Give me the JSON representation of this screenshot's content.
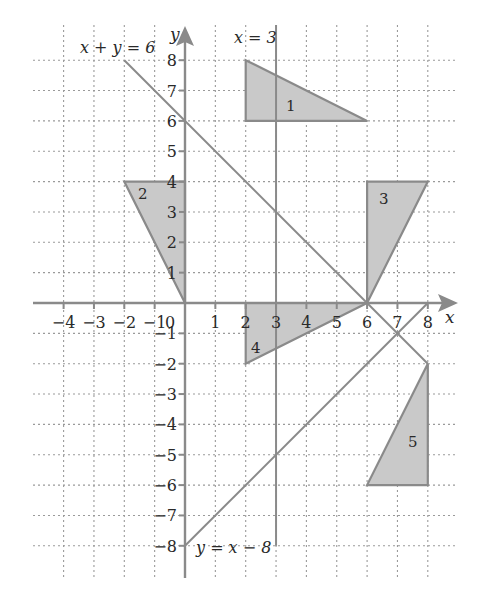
{
  "figure": {
    "axes": {
      "x_label": "x",
      "y_label": "y",
      "origin_label": "0",
      "x_ticks": [
        "-4",
        "-3",
        "-2",
        "-1",
        "1",
        "2",
        "3",
        "4",
        "5",
        "6",
        "7",
        "8"
      ],
      "y_ticks": [
        "8",
        "7",
        "6",
        "5",
        "4",
        "3",
        "2",
        "1",
        "-1",
        "-2",
        "-3",
        "-4",
        "-5",
        "-6",
        "-7",
        "-8"
      ],
      "x_range": [
        -5,
        9
      ],
      "y_range": [
        -9,
        9
      ],
      "grid": "dotted, 1 unit"
    },
    "lines": [
      {
        "label": "x + y = 6",
        "from": [
          -2,
          8
        ],
        "to": [
          8,
          -2
        ]
      },
      {
        "label": "x = 3",
        "from": [
          3,
          9
        ],
        "to": [
          3,
          -8
        ]
      },
      {
        "label": "y = x − 8",
        "from": [
          0,
          -8
        ],
        "to": [
          8,
          0
        ]
      }
    ],
    "shapes": [
      {
        "label": "1",
        "vertices": [
          [
            2,
            8
          ],
          [
            2,
            6
          ],
          [
            6,
            6
          ]
        ]
      },
      {
        "label": "2",
        "vertices": [
          [
            -2,
            4
          ],
          [
            0,
            4
          ],
          [
            0,
            0
          ]
        ]
      },
      {
        "label": "3",
        "vertices": [
          [
            6,
            4
          ],
          [
            8,
            4
          ],
          [
            6,
            0
          ]
        ]
      },
      {
        "label": "4",
        "vertices": [
          [
            2,
            0
          ],
          [
            6,
            0
          ],
          [
            2,
            -2
          ]
        ]
      },
      {
        "label": "5",
        "vertices": [
          [
            8,
            -2
          ],
          [
            8,
            -6
          ],
          [
            6,
            -6
          ]
        ]
      }
    ],
    "colors": {
      "line": "#8a8a8a",
      "fill": "#c9c9c9",
      "grid": "#9a9a9a",
      "text": "#2a2a2a"
    }
  }
}
